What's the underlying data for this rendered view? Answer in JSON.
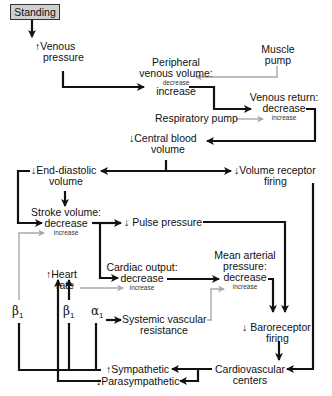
{
  "diagram": {
    "title_box": "Standing",
    "nodes": {
      "venous_pressure": {
        "arrow": "↑",
        "line1": "Venous",
        "line2": "pressure"
      },
      "peripheral_venous_volume": {
        "line1": "Peripheral",
        "line2": "venous volume:",
        "small": "decrease",
        "main": "increase"
      },
      "muscle_pump": {
        "line1": "Muscle",
        "line2": "pump"
      },
      "venous_return": {
        "line1": "Venous return:",
        "main": "decrease",
        "small": "increase"
      },
      "respiratory_pump": {
        "label": "Respiratory pump"
      },
      "central_blood_volume": {
        "arrow": "↓",
        "line1": "Central blood",
        "line2": "volume"
      },
      "end_diastolic_volume": {
        "arrow": "↓",
        "line1": "End-diastolic",
        "line2": "volume"
      },
      "volume_receptor_firing": {
        "arrow": "↓",
        "line1": "Volume receptor",
        "line2": "firing"
      },
      "stroke_volume": {
        "line1": "Stroke volume:",
        "main": "decrease",
        "small": "increase"
      },
      "pulse_pressure": {
        "arrow": "↓",
        "label": "Pulse pressure"
      },
      "cardiac_output": {
        "line1": "Cardiac output:",
        "main": "decrease",
        "small": "increase"
      },
      "mean_arterial_pressure": {
        "line1": "Mean arterial",
        "line2": "pressure:",
        "main": "decrease",
        "small": "increase"
      },
      "heart_rate": {
        "arrow": "↑",
        "line1": "Heart",
        "line2": "rate"
      },
      "systemic_vascular_resistance": {
        "line1": "Systemic vascular",
        "line2": "resistance"
      },
      "baroreceptor_firing": {
        "arrow": "↓",
        "line1": "Baroreceptor",
        "line2": "firing"
      },
      "cardiovascular_centers": {
        "line1": "Cardiovascular",
        "line2": "centers"
      },
      "sympathetic": {
        "arrow": "↑",
        "label": "Sympathetic"
      },
      "parasympathetic": {
        "arrow": "↓",
        "label": "Parasympathetic"
      }
    },
    "receptors": {
      "beta1_left": {
        "sym": "β",
        "sub": "1"
      },
      "beta1_mid": {
        "sym": "β",
        "sub": "1"
      },
      "alpha1": {
        "sym": "α",
        "sub": "1"
      }
    },
    "colors": {
      "primary_line": "#111111",
      "secondary_line": "#a8a8a8",
      "box_fill": "#cfcfcf"
    }
  }
}
